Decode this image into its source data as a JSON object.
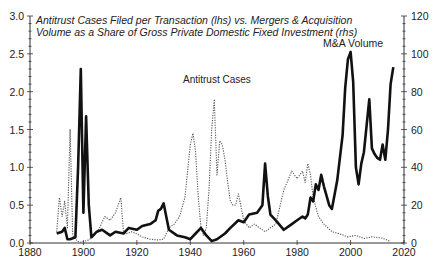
{
  "chart_data": {
    "type": "line",
    "title_lines": [
      "Antitrust Cases Filed per Transaction (lhs) vs. Mergers & Acquisition",
      "Volume as a Share of Gross Private Domestic Fixed Investment (rhs)"
    ],
    "xlabel": "",
    "ylabel_left": "",
    "ylabel_right": "",
    "xlim": [
      1880,
      2020
    ],
    "ylim_left": [
      0,
      3.0
    ],
    "ylim_right": [
      0,
      120
    ],
    "x_ticks": [
      "1880",
      "1900",
      "1920",
      "1940",
      "1960",
      "1980",
      "2000",
      "2020"
    ],
    "y_ticks_left": [
      "0.0",
      "0.5",
      "1.0",
      "1.5",
      "2.0",
      "2.5",
      "3.0"
    ],
    "y_ticks_right": [
      "0",
      "20",
      "40",
      "60",
      "80",
      "100",
      "120"
    ],
    "grid": false,
    "legend": "inline annotations",
    "annotations": [
      {
        "text": "Antitrust Cases",
        "x": 1948,
        "y_left": 2.1
      },
      {
        "text": "M&A Volume",
        "x": 2000,
        "y_right": 106
      }
    ],
    "series": [
      {
        "name": "Antitrust Cases",
        "axis": "left",
        "style": "dotted",
        "x": [
          1890,
          1891,
          1892,
          1893,
          1894,
          1895,
          1896,
          1897,
          1898,
          1899,
          1900,
          1902,
          1904,
          1906,
          1908,
          1910,
          1912,
          1914,
          1915,
          1916,
          1918,
          1920,
          1922,
          1925,
          1928,
          1930,
          1932,
          1934,
          1936,
          1938,
          1940,
          1941,
          1942,
          1943,
          1944,
          1945,
          1946,
          1947,
          1948,
          1949,
          1950,
          1951,
          1952,
          1953,
          1954,
          1955,
          1956,
          1957,
          1958,
          1960,
          1962,
          1964,
          1966,
          1968,
          1970,
          1972,
          1975,
          1978,
          1980,
          1982,
          1983,
          1984,
          1985,
          1986,
          1988,
          1990,
          1993,
          1996,
          1999,
          2002,
          2005,
          2008,
          2011,
          2013,
          2015
        ],
        "values": [
          0.15,
          0.6,
          0.35,
          0.55,
          0.2,
          1.5,
          0.1,
          0.05,
          0.02,
          0.01,
          0.02,
          0.04,
          0.1,
          0.2,
          0.35,
          0.3,
          0.4,
          0.6,
          0.15,
          0.12,
          0.15,
          0.12,
          0.08,
          0.05,
          0.04,
          0.05,
          0.2,
          0.25,
          0.35,
          0.6,
          1.3,
          1.45,
          1.2,
          0.6,
          0.2,
          0.1,
          0.2,
          0.7,
          1.5,
          1.9,
          0.9,
          1.35,
          1.3,
          1.1,
          0.8,
          0.55,
          0.5,
          0.5,
          0.65,
          0.3,
          0.2,
          0.25,
          0.2,
          0.15,
          0.2,
          0.25,
          0.7,
          0.95,
          0.85,
          0.95,
          0.8,
          1.05,
          0.9,
          0.6,
          0.35,
          0.25,
          0.15,
          0.12,
          0.08,
          0.1,
          0.06,
          0.08,
          0.07,
          0.05,
          0.02
        ]
      },
      {
        "name": "M&A Volume",
        "axis": "right",
        "style": "solid-thick",
        "x": [
          1890,
          1892,
          1893,
          1894,
          1895,
          1897,
          1898,
          1899,
          1900,
          1901,
          1902,
          1903,
          1905,
          1907,
          1910,
          1912,
          1915,
          1917,
          1920,
          1922,
          1925,
          1927,
          1928,
          1929,
          1930,
          1932,
          1935,
          1938,
          1940,
          1942,
          1944,
          1946,
          1948,
          1950,
          1953,
          1955,
          1958,
          1960,
          1962,
          1965,
          1967,
          1968,
          1969,
          1970,
          1972,
          1975,
          1978,
          1980,
          1982,
          1983,
          1984,
          1985,
          1986,
          1987,
          1988,
          1989,
          1990,
          1992,
          1993,
          1995,
          1996,
          1997,
          1998,
          1999,
          2000,
          2001,
          2002,
          2003,
          2004,
          2005,
          2006,
          2007,
          2008,
          2009,
          2010,
          2011,
          2012,
          2013,
          2014,
          2015,
          2016
        ],
        "values": [
          5,
          6,
          8,
          2,
          2,
          3,
          40,
          92,
          16,
          67,
          20,
          3,
          6,
          7,
          4,
          6,
          5,
          8,
          7,
          9,
          10,
          12,
          17,
          18,
          21,
          7,
          4,
          3,
          2,
          5,
          8,
          4,
          1,
          2,
          5,
          8,
          12,
          11,
          15,
          16,
          20,
          42,
          25,
          15,
          12,
          7,
          10,
          12,
          14,
          13,
          15,
          24,
          22,
          31,
          28,
          36,
          30,
          20,
          18,
          33,
          45,
          57,
          82,
          97,
          101,
          85,
          40,
          31,
          42,
          48,
          62,
          76,
          50,
          47,
          45,
          44,
          52,
          44,
          60,
          84,
          93
        ]
      }
    ]
  }
}
